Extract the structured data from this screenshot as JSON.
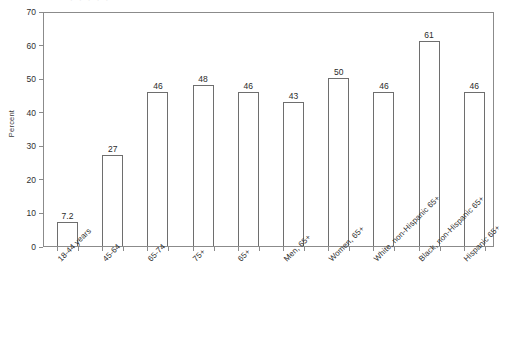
{
  "figure": {
    "top_artifact_text": "· · ·  ·  ·",
    "background_color": "#ffffff",
    "axis_color": "#8b8b8b",
    "bar_edge_color": "#6e6e6e",
    "bar_fill_color": "#ffffff"
  },
  "chart_data": {
    "type": "bar",
    "title": "",
    "subtitle": "",
    "xlabel": "",
    "ylabel": "Percent",
    "ylim": [
      0,
      70
    ],
    "yticks": [
      0,
      10,
      20,
      30,
      40,
      50,
      60,
      70
    ],
    "ytick_labels": [
      "0",
      "10",
      "20",
      "30",
      "40",
      "50",
      "60",
      "70"
    ],
    "grid": false,
    "legend": false,
    "legend_position": "none",
    "categories": [
      "18-44 years",
      "45-64",
      "65-74",
      "75+",
      "65+",
      "Men, 65+",
      "Women, 65+",
      "White, non-Hispanic 65+",
      "Black, non-Hispanic 65+",
      "Hispanic 65+"
    ],
    "values": [
      7.2,
      27,
      46,
      48,
      46,
      43,
      50,
      46,
      61,
      46
    ],
    "data_labels": [
      "7.2",
      "27",
      "46",
      "48",
      "46",
      "43",
      "50",
      "46",
      "61",
      "46"
    ]
  }
}
